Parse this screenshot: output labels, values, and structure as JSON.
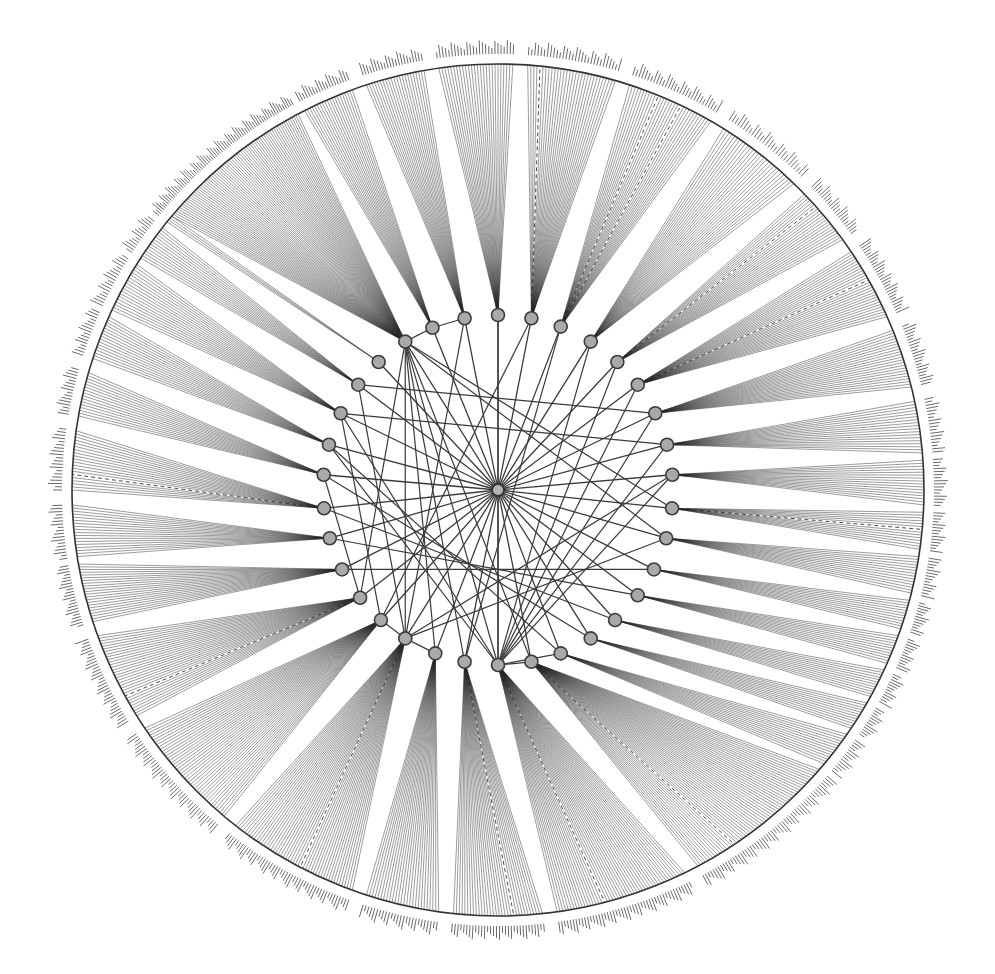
{
  "diagram": {
    "type": "radial-tree",
    "center": {
      "x": 498,
      "y": 490
    },
    "hub": {
      "radius": 6
    },
    "ring": {
      "radius": 175,
      "node_radius": 6.5
    },
    "outer": {
      "radius": 426,
      "gap_radius": 430,
      "label_radius": 436
    },
    "colors": {
      "background": "#ffffff",
      "edge": "#3a3a3a",
      "node_fill": "#a9a9a9",
      "node_stroke": "#3c3c3c",
      "leaf_label": "#5a5a5a"
    },
    "ring_nodes": [
      {
        "id": "n01",
        "angle": -122,
        "fan": [
          -140,
          -118
        ],
        "leaves": 70
      },
      {
        "id": "n02",
        "angle": -112,
        "fan": [
          -117,
          -110
        ],
        "leaves": 20
      },
      {
        "id": "n03",
        "angle": -101,
        "fan": [
          -108,
          -100
        ],
        "leaves": 22
      },
      {
        "id": "n04",
        "angle": -90,
        "fan": [
          -98,
          -88
        ],
        "leaves": 26
      },
      {
        "id": "n05",
        "angle": -79,
        "fan": [
          -86,
          -74
        ],
        "leaves": 30
      },
      {
        "id": "n06",
        "angle": -69,
        "fan": [
          -72,
          -60
        ],
        "leaves": 30
      },
      {
        "id": "n07",
        "angle": -58,
        "fan": [
          -58,
          -46
        ],
        "leaves": 28
      },
      {
        "id": "n08",
        "angle": -47,
        "fan": [
          -44,
          -36
        ],
        "leaves": 22
      },
      {
        "id": "n09",
        "angle": -37,
        "fan": [
          -34,
          -24
        ],
        "leaves": 28
      },
      {
        "id": "n10",
        "angle": -26,
        "fan": [
          -22,
          -14
        ],
        "leaves": 22
      },
      {
        "id": "n11",
        "angle": -15,
        "fan": [
          -12,
          -5
        ],
        "leaves": 18
      },
      {
        "id": "n12",
        "angle": -5,
        "fan": [
          -4,
          2
        ],
        "leaves": 16
      },
      {
        "id": "n13",
        "angle": 6,
        "fan": [
          3,
          8
        ],
        "leaves": 14
      },
      {
        "id": "n14",
        "angle": 16,
        "fan": [
          9,
          14
        ],
        "leaves": 14
      },
      {
        "id": "n15",
        "angle": 27,
        "fan": [
          15,
          19
        ],
        "leaves": 12
      },
      {
        "id": "n16",
        "angle": 37,
        "fan": [
          20,
          24
        ],
        "leaves": 12
      },
      {
        "id": "n17",
        "angle": 48,
        "fan": [
          25,
          29
        ],
        "leaves": 12
      },
      {
        "id": "n18",
        "angle": 58,
        "fan": [
          30,
          34
        ],
        "leaves": 12
      },
      {
        "id": "n19",
        "angle": 69,
        "fan": [
          35,
          40
        ],
        "leaves": 14
      },
      {
        "id": "n20",
        "angle": 79,
        "fan": [
          41,
          62
        ],
        "leaves": 56
      },
      {
        "id": "n21",
        "angle": 90,
        "fan": [
          64,
          82
        ],
        "leaves": 48
      },
      {
        "id": "n22",
        "angle": 101,
        "fan": [
          84,
          96
        ],
        "leaves": 32
      },
      {
        "id": "n23",
        "angle": 111,
        "fan": [
          98,
          108
        ],
        "leaves": 26
      },
      {
        "id": "n24",
        "angle": 122,
        "fan": [
          110,
          128
        ],
        "leaves": 48
      },
      {
        "id": "n25",
        "angle": 132,
        "fan": [
          130,
          146
        ],
        "leaves": 42
      },
      {
        "id": "n26",
        "angle": 142,
        "fan": [
          148,
          160
        ],
        "leaves": 32
      },
      {
        "id": "n27",
        "angle": 153,
        "fan": [
          162,
          170
        ],
        "leaves": 22
      },
      {
        "id": "n28",
        "angle": 164,
        "fan": [
          171,
          178
        ],
        "leaves": 18
      },
      {
        "id": "n29",
        "angle": 174,
        "fan": [
          180,
          188
        ],
        "leaves": 20
      },
      {
        "id": "n30",
        "angle": 185,
        "fan": [
          190,
          196
        ],
        "leaves": 16
      },
      {
        "id": "n31",
        "angle": 195,
        "fan": [
          198,
          204
        ],
        "leaves": 16
      },
      {
        "id": "n32",
        "angle": 206,
        "fan": [
          205,
          212
        ],
        "leaves": 18
      },
      {
        "id": "n33",
        "angle": 217,
        "fan": [
          213,
          218
        ],
        "leaves": 14
      },
      {
        "id": "n34",
        "angle": 227,
        "fan": [
          219,
          220
        ],
        "leaves": 4
      }
    ],
    "cross_edges": [
      [
        "n01",
        "n21"
      ],
      [
        "n01",
        "n22"
      ],
      [
        "n01",
        "n23"
      ],
      [
        "n01",
        "n20"
      ],
      [
        "n01",
        "n24"
      ],
      [
        "n01",
        "n13"
      ],
      [
        "n01",
        "n14"
      ],
      [
        "n01",
        "n26"
      ],
      [
        "n01",
        "n02"
      ],
      [
        "n02",
        "n03"
      ],
      [
        "n03",
        "n24"
      ],
      [
        "n04",
        "n21"
      ],
      [
        "n05",
        "n25"
      ],
      [
        "n06",
        "n22"
      ],
      [
        "n21",
        "n09"
      ],
      [
        "n21",
        "n10"
      ],
      [
        "n21",
        "n08"
      ],
      [
        "n21",
        "n07"
      ],
      [
        "n21",
        "n11"
      ],
      [
        "n21",
        "n12"
      ],
      [
        "n21",
        "n31"
      ],
      [
        "n21",
        "n32"
      ],
      [
        "n21",
        "n20"
      ],
      [
        "n21",
        "n19"
      ],
      [
        "n24",
        "n33"
      ],
      [
        "n24",
        "n25"
      ],
      [
        "n24",
        "n23"
      ],
      [
        "n24",
        "n12"
      ],
      [
        "n24",
        "n14"
      ],
      [
        "n25",
        "n32"
      ],
      [
        "n26",
        "n30"
      ],
      [
        "n27",
        "n15"
      ],
      [
        "n28",
        "n16"
      ],
      [
        "n29",
        "n17"
      ],
      [
        "n30",
        "n18"
      ],
      [
        "n31",
        "n19"
      ],
      [
        "n32",
        "n11"
      ],
      [
        "n33",
        "n10"
      ]
    ],
    "dashed_leaves": [
      {
        "node": "n05",
        "index": 4
      },
      {
        "node": "n06",
        "index": 10
      },
      {
        "node": "n06",
        "index": 18
      },
      {
        "node": "n08",
        "index": 6
      },
      {
        "node": "n09",
        "index": 12
      },
      {
        "node": "n21",
        "index": 30
      },
      {
        "node": "n22",
        "index": 10
      },
      {
        "node": "n24",
        "index": 20
      },
      {
        "node": "n26",
        "index": 8
      },
      {
        "node": "n29",
        "index": 5
      },
      {
        "node": "n20",
        "index": 40
      },
      {
        "node": "n13",
        "index": 6
      }
    ],
    "leaf_labels_legible": false
  }
}
